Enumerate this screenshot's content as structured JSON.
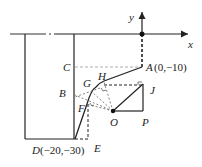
{
  "diagram": {
    "type": "geometry-coordinate-figure",
    "axes": {
      "x_label": "x",
      "y_label": "y"
    },
    "points": {
      "A": {
        "label": "A",
        "coords": "(0,−10)"
      },
      "B": {
        "label": "B"
      },
      "C": {
        "label": "C"
      },
      "D": {
        "label": "D",
        "coords": "(−20,−30)"
      },
      "E": {
        "label": "E"
      },
      "F": {
        "label": "F"
      },
      "G": {
        "label": "G"
      },
      "H": {
        "label": "H"
      },
      "J": {
        "label": "J"
      },
      "O": {
        "label": "O"
      },
      "P": {
        "label": "P"
      }
    },
    "colors": {
      "line": "#222222",
      "dashed": "#333333",
      "light_dashed": "#999999"
    }
  }
}
